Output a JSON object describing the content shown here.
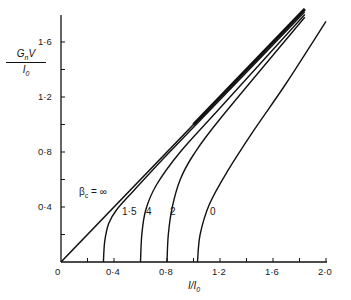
{
  "chart_data": {
    "type": "line",
    "title": "",
    "xlabel": "I/I0",
    "ylabel": "GnV/I0",
    "xlim": [
      0,
      2.0
    ],
    "ylim": [
      0,
      1.8
    ],
    "grid": false,
    "legend": "inline curve labels",
    "x_ticks": [
      0,
      0.2,
      0.4,
      0.6,
      0.8,
      1.0,
      1.2,
      1.4,
      1.6,
      1.8,
      2.0
    ],
    "x_tick_labels": [
      "0",
      "0·4",
      "0·8",
      "1·2",
      "1·6",
      "2·0"
    ],
    "y_ticks": [
      0,
      0.2,
      0.4,
      0.6,
      0.8,
      1.0,
      1.2,
      1.4,
      1.6
    ],
    "y_tick_labels": [
      "0",
      "0·4",
      "0·8",
      "1·2",
      "1·6"
    ],
    "param_label": "βc = ∞",
    "series": [
      {
        "name": "βc = ∞",
        "label": "βc = ∞",
        "points": [
          [
            0,
            0
          ],
          [
            1.84,
            1.84
          ]
        ]
      },
      {
        "name": "βc = 1.5",
        "label": "1·5",
        "points": [
          [
            0.32,
            0
          ],
          [
            0.33,
            0.15
          ],
          [
            0.36,
            0.28
          ],
          [
            0.42,
            0.38
          ],
          [
            0.55,
            0.52
          ],
          [
            0.8,
            0.78
          ],
          [
            1.2,
            1.18
          ],
          [
            1.84,
            1.82
          ]
        ]
      },
      {
        "name": "βc = 4",
        "label": "4",
        "points": [
          [
            0.6,
            0
          ],
          [
            0.61,
            0.2
          ],
          [
            0.64,
            0.38
          ],
          [
            0.72,
            0.56
          ],
          [
            0.9,
            0.8
          ],
          [
            1.2,
            1.12
          ],
          [
            1.84,
            1.8
          ]
        ]
      },
      {
        "name": "βc = 2",
        "label": "2",
        "points": [
          [
            0.8,
            0
          ],
          [
            0.81,
            0.2
          ],
          [
            0.84,
            0.4
          ],
          [
            0.9,
            0.6
          ],
          [
            1.0,
            0.78
          ],
          [
            1.2,
            1.04
          ],
          [
            1.84,
            1.78
          ]
        ]
      },
      {
        "name": "βc = 0",
        "label": "0",
        "points": [
          [
            1.03,
            0
          ],
          [
            1.05,
            0.2
          ],
          [
            1.12,
            0.42
          ],
          [
            1.25,
            0.65
          ],
          [
            1.45,
            0.95
          ],
          [
            1.7,
            1.3
          ],
          [
            2.0,
            1.75
          ]
        ]
      }
    ]
  },
  "axes": {
    "ylabel_num": "GnV",
    "ylabel_den": "I0",
    "xlabel": "I/I0",
    "origin": "0",
    "beta_label": "βc = ∞"
  },
  "curve_labels": [
    "1·5",
    "4",
    "2",
    "0"
  ]
}
